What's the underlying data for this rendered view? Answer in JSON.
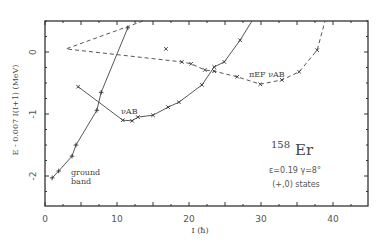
{
  "chart_data": {
    "type": "line",
    "title": "",
    "xlabel": "I (ħ)",
    "ylabel": "E - 0.007 I(I+1)  (MeV)",
    "xlim": [
      0,
      45
    ],
    "ylim": [
      -2.48,
      0.5
    ],
    "xticks": [
      0,
      10,
      20,
      30,
      40
    ],
    "yticks": [
      0,
      -1,
      -2
    ],
    "grid": false,
    "series": [
      {
        "name": "ground band",
        "marker": "+",
        "line": "solid",
        "x": [
          1.0,
          1.9,
          3.75,
          4.3,
          7.2,
          7.8,
          11.5
        ],
        "y": [
          -2.03,
          -1.92,
          -1.68,
          -1.5,
          -0.94,
          -0.65,
          0.39
        ]
      },
      {
        "name": "νAB",
        "marker": "×",
        "line": "solid",
        "x": [
          4.6,
          10.8,
          12.1,
          12.9,
          15.0,
          17.1,
          18.6,
          21.8,
          23.5,
          24.9,
          27.1
        ],
        "y": [
          -0.56,
          -1.1,
          -1.11,
          -1.05,
          -1.02,
          -0.89,
          -0.81,
          -0.53,
          -0.24,
          -0.16,
          0.19
        ]
      },
      {
        "name": "πEFνAB",
        "marker": "×",
        "line": "dashed",
        "x": [
          16.8,
          19.0,
          20.3,
          22.2,
          23.5,
          26.7,
          29.9,
          32.9,
          35.3,
          37.8
        ],
        "y": [
          0.05,
          -0.16,
          -0.19,
          -0.29,
          -0.31,
          -0.4,
          -0.52,
          -0.45,
          -0.32,
          0.03
        ]
      }
    ],
    "annotations": {
      "nucleus_mass": "158",
      "nucleus_symbol": "Er",
      "params": "ε=0.19   γ=8°",
      "states": "(+,0) states",
      "label_ground_1": "ground",
      "label_ground_2": "band",
      "label_vab": "νAB",
      "label_pief": "πEF νAB"
    }
  },
  "axis": {
    "x_tick_labels": [
      "0",
      "10",
      "20",
      "30",
      "40"
    ],
    "y_tick_labels": [
      "0",
      "-1",
      "-2"
    ]
  }
}
